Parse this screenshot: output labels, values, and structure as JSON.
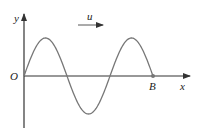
{
  "diagram": {
    "type": "transverse-wave",
    "axes": {
      "x_label": "x",
      "y_label": "y",
      "origin_label": "O"
    },
    "wave": {
      "velocity_label": "u",
      "velocity_direction": "right",
      "end_point_label": "B",
      "wavelengths_shown": 1.5,
      "starts_at_origin_going": "up"
    },
    "colors": {
      "axis": "#333333",
      "curve": "#777777",
      "text": "#222222"
    }
  }
}
